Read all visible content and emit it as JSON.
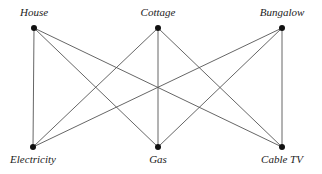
{
  "diagram": {
    "type": "bipartite-graph",
    "top_nodes": [
      {
        "id": "house",
        "label": "House",
        "x": 34,
        "y": 28
      },
      {
        "id": "cottage",
        "label": "Cottage",
        "x": 158,
        "y": 28
      },
      {
        "id": "bungalow",
        "label": "Bungalow",
        "x": 282,
        "y": 28
      }
    ],
    "bottom_nodes": [
      {
        "id": "electricity",
        "label": "Electricity",
        "x": 33,
        "y": 147
      },
      {
        "id": "gas",
        "label": "Gas",
        "x": 158,
        "y": 147
      },
      {
        "id": "cabletv",
        "label": "Cable TV",
        "x": 282,
        "y": 147
      }
    ],
    "edges": [
      [
        "house",
        "electricity"
      ],
      [
        "house",
        "gas"
      ],
      [
        "house",
        "cabletv"
      ],
      [
        "cottage",
        "electricity"
      ],
      [
        "cottage",
        "gas"
      ],
      [
        "cottage",
        "cabletv"
      ],
      [
        "bungalow",
        "electricity"
      ],
      [
        "bungalow",
        "gas"
      ],
      [
        "bungalow",
        "cabletv"
      ]
    ],
    "line_color": "#555555",
    "node_color": "#111111"
  }
}
